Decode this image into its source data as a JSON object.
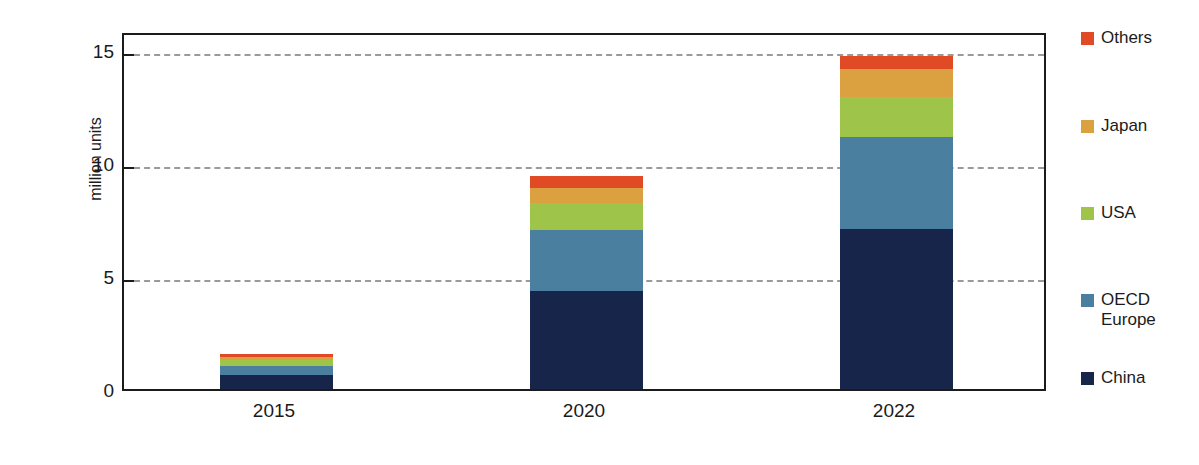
{
  "chart_data": {
    "type": "bar",
    "subtype": "stacked-vertical",
    "title": "",
    "xlabel": "",
    "ylabel": "million units",
    "categories": [
      "2015",
      "2020",
      "2022"
    ],
    "ylim": [
      0,
      16
    ],
    "yticks": [
      0,
      5,
      10,
      15
    ],
    "ytick_labels": [
      "0",
      "5",
      "10",
      "15"
    ],
    "grid": "horizontal-dashed",
    "legend_position": "right",
    "stack_order_bottom_to_top": [
      "China",
      "OECD Europe",
      "USA",
      "Japan",
      "Others"
    ],
    "series": [
      {
        "name": "China",
        "color": "#17254a",
        "values": [
          0.62,
          4.4,
          7.15
        ]
      },
      {
        "name": "OECD Europe",
        "color": "#4a7fa0",
        "values": [
          0.4,
          2.7,
          4.1
        ]
      },
      {
        "name": "USA",
        "color": "#9ec44a",
        "values": [
          0.28,
          1.2,
          1.8
        ]
      },
      {
        "name": "Japan",
        "color": "#dba03f",
        "values": [
          0.12,
          0.7,
          1.25
        ]
      },
      {
        "name": "Others",
        "color": "#e04a25",
        "values": [
          0.13,
          0.5,
          0.6
        ]
      }
    ],
    "totals": [
      1.55,
      9.5,
      14.9
    ]
  },
  "legend": {
    "items": [
      {
        "label": "Others",
        "color": "#e04a25"
      },
      {
        "label": "Japan",
        "color": "#dba03f"
      },
      {
        "label": "USA",
        "color": "#9ec44a"
      },
      {
        "label": "OECD\nEurope",
        "color": "#4a7fa0"
      },
      {
        "label": "China",
        "color": "#17254a"
      }
    ]
  },
  "axis": {
    "y_title": "million units",
    "y_tick_labels": [
      "15",
      "10",
      "5",
      "0"
    ],
    "x_tick_labels": [
      "2015",
      "2020",
      "2022"
    ]
  },
  "colors": {
    "axis": "#1b1b1b",
    "grid": "#9a9a9a",
    "background": "#ffffff"
  }
}
